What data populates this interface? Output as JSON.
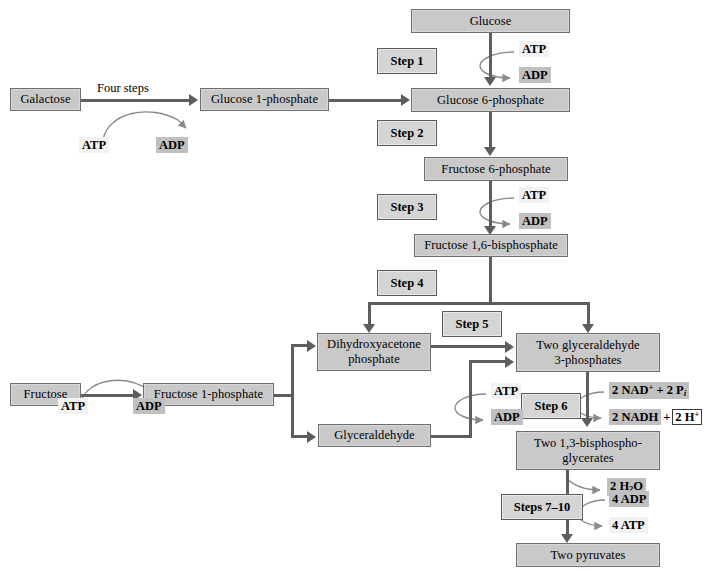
{
  "diagram": {
    "colors": {
      "box_fill": "#c9c9c9",
      "box_border": "#6e6e6e",
      "step_fill": "#d5d5d5",
      "arrow": "#5d5d5d",
      "cofactor_light": "#f2f2f2",
      "cofactor_dark": "#c0c0c0"
    }
  },
  "metabolites": {
    "glucose": "Glucose",
    "galactose": "Galactose",
    "glucose_1_phosphate": "Glucose 1-phosphate",
    "glucose_6_phosphate": "Glucose 6-phosphate",
    "fructose_6_phosphate": "Fructose 6-phosphate",
    "fructose_1_6_bisphosphate": "Fructose 1,6-bisphosphate",
    "dhap_line1": "Dihydroxyacetone",
    "dhap_line2": "phosphate",
    "g3p_line1": "Two glyceraldehyde",
    "g3p_line2": "3-phosphates",
    "fructose": "Fructose",
    "fructose_1_phosphate": "Fructose 1-phosphate",
    "glyceraldehyde": "Glyceraldehyde",
    "bpg_line1": "Two 1,3-bisphospho-",
    "bpg_line2": "glycerates",
    "pyruvate": "Two pyruvates"
  },
  "steps": {
    "step1": "Step 1",
    "step2": "Step 2",
    "step3": "Step 3",
    "step4": "Step 4",
    "step5": "Step 5",
    "step6": "Step 6",
    "steps7_10": "Steps 7–10",
    "four_steps": "Four steps"
  },
  "cofactors": {
    "galactose_atp": "ATP",
    "galactose_adp": "ADP",
    "step1_atp": "ATP",
    "step1_adp": "ADP",
    "step3_atp": "ATP",
    "step3_adp": "ADP",
    "fructose_atp": "ATP",
    "fructose_adp": "ADP",
    "glyceraldehyde_atp": "ATP",
    "glyceraldehyde_adp": "ADP",
    "nad_in_pre": "2 NAD",
    "nad_in_charge": "+",
    "nad_in_post": " + 2 P",
    "nad_in_sub": "i",
    "nadh_out": "2 NADH",
    "nadh_plus": "+",
    "proton_pre": "2 H",
    "proton_charge": "+",
    "water": "2 H",
    "water_sub": "2",
    "water_post": "O",
    "adp4": "4 ADP",
    "atp4": "4 ATP"
  }
}
